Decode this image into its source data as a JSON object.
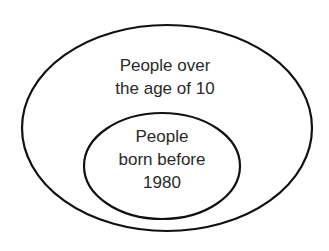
{
  "diagram": {
    "type": "nested-euler",
    "colors": {
      "stroke": "#111111",
      "text": "#2a2a2a",
      "background": "#ffffff"
    },
    "outer": {
      "label_lines": [
        "People over",
        "the age of 10"
      ]
    },
    "inner": {
      "label_lines": [
        "People",
        "born before",
        "1980"
      ]
    }
  }
}
